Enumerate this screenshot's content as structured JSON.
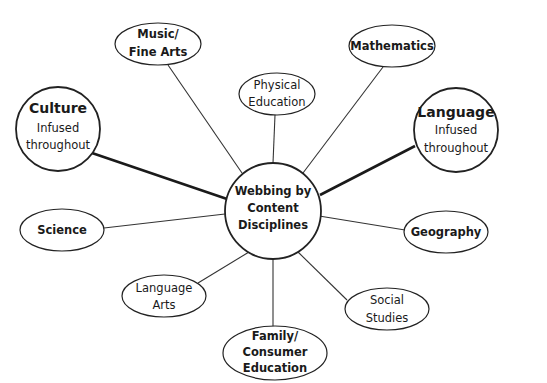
{
  "diagram": {
    "type": "concept-web",
    "center": {
      "lines": [
        "Webbing by",
        "Content",
        "Disciplines"
      ]
    },
    "infused_nodes": [
      {
        "id": "culture",
        "title": "Culture",
        "lines": [
          "Infused",
          "throughout"
        ]
      },
      {
        "id": "language",
        "title": "Language",
        "lines": [
          "Infused",
          "throughout"
        ]
      }
    ],
    "discipline_nodes": [
      {
        "id": "music",
        "lines": [
          "Music/",
          "Fine Arts"
        ]
      },
      {
        "id": "physical",
        "lines": [
          "Physical",
          "Education"
        ]
      },
      {
        "id": "mathematics",
        "lines": [
          "Mathematics"
        ]
      },
      {
        "id": "science",
        "lines": [
          "Science"
        ]
      },
      {
        "id": "geography",
        "lines": [
          "Geography"
        ]
      },
      {
        "id": "language-arts",
        "lines": [
          "Language",
          "Arts"
        ]
      },
      {
        "id": "social-studies",
        "lines": [
          "Social",
          "Studies"
        ]
      },
      {
        "id": "family",
        "lines": [
          "Family/",
          "Consumer",
          "Education"
        ]
      }
    ]
  }
}
